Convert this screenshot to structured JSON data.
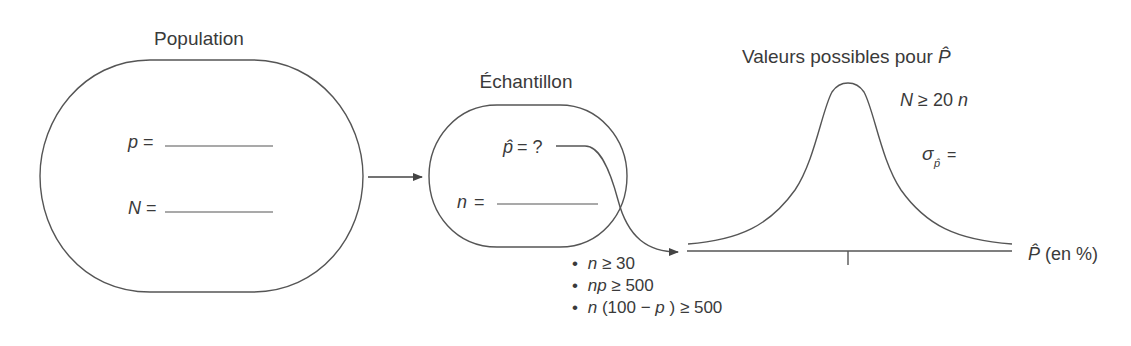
{
  "population": {
    "title": "Population",
    "p_label": "p",
    "N_label": "N",
    "equals": "="
  },
  "sample": {
    "title": "Échantillon",
    "phat_label": "p̂",
    "phat_value": "= ?",
    "n_label": "n",
    "equals": "="
  },
  "conditions": [
    {
      "bullet": "•",
      "var": "n",
      "rest": " ≥ 30"
    },
    {
      "bullet": "•",
      "var": "np",
      "rest": " ≥ 500"
    },
    {
      "bullet": "•",
      "var": "n",
      "rest": "(100 − ",
      "var2": "p",
      "rest2": ") ≥ 500"
    }
  ],
  "distribution": {
    "title": "Valeurs possibles pour ",
    "title_var": "P̂",
    "condition_N": "N",
    "condition_rest": " ≥ 20",
    "condition_n": "n",
    "sigma": "σ",
    "sigma_sub": "p̂",
    "sigma_eq": "=",
    "axis_var": "P̂",
    "axis_unit": " (en %)"
  },
  "colors": {
    "stroke": "#555555",
    "text": "#3a3a3a",
    "background": "#ffffff"
  }
}
